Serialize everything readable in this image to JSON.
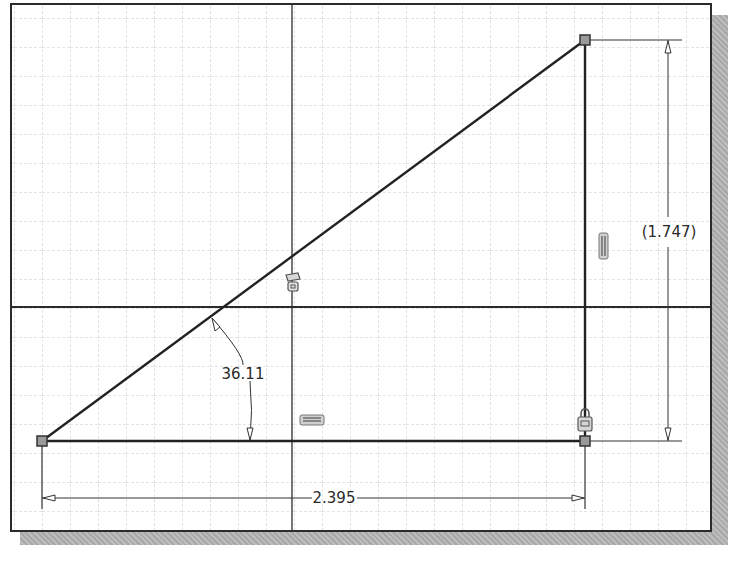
{
  "sketch": {
    "title": "2D sketch - right triangle with dimensions and constraints",
    "colors": {
      "background": "#ffffff",
      "frame": "#2b2b2b",
      "grid": "#c8c8c8",
      "geometry": "#222222",
      "point_fill": "#9a9a9a",
      "shadow": "#b0b0b0"
    },
    "dimensions": {
      "horizontal": {
        "label": "2.395"
      },
      "vertical": {
        "label": "(1.747)"
      },
      "angle": {
        "label": "36.11"
      }
    },
    "constraints": [
      {
        "name": "coincident-icon",
        "type": "coincident"
      },
      {
        "name": "vertical-constraint-icon",
        "type": "vertical"
      },
      {
        "name": "horizontal-constraint-icon",
        "type": "horizontal"
      },
      {
        "name": "fix-constraint-icon",
        "type": "fix"
      }
    ],
    "points": [
      {
        "name": "point-bottom-left"
      },
      {
        "name": "point-bottom-right"
      },
      {
        "name": "point-top-right"
      }
    ]
  }
}
